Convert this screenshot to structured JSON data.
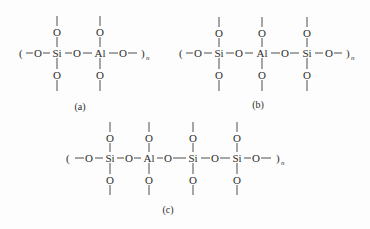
{
  "figure": {
    "background": "#fdfdfd",
    "ink_color": "#2b2b2b",
    "structures": [
      {
        "id": "a",
        "caption": "(a)",
        "open_paren": "(",
        "close_paren": ")",
        "repeat_subscript": "n",
        "chain": [
          "O",
          "Si",
          "O",
          "Al",
          "O"
        ],
        "centers": [
          {
            "element": "Si",
            "pendant_top": "O",
            "pendant_bottom": "O"
          },
          {
            "element": "Al",
            "pendant_top": "O",
            "pendant_bottom": "O"
          }
        ]
      },
      {
        "id": "b",
        "caption": "(b)",
        "open_paren": "(",
        "close_paren": ")",
        "repeat_subscript": "n",
        "chain": [
          "O",
          "Si",
          "O",
          "Al",
          "O",
          "Si",
          "O"
        ],
        "centers": [
          {
            "element": "Si",
            "pendant_top": "O",
            "pendant_bottom": "O"
          },
          {
            "element": "Al",
            "pendant_top": "O",
            "pendant_bottom": "O"
          },
          {
            "element": "Si",
            "pendant_top": "O",
            "pendant_bottom": "O"
          }
        ]
      },
      {
        "id": "c",
        "caption": "(c)",
        "open_paren": "(",
        "close_paren": ")",
        "repeat_subscript": "n",
        "chain": [
          "O",
          "Si",
          "O",
          "Al",
          "O",
          "Si",
          "O",
          "Si",
          "O"
        ],
        "centers": [
          {
            "element": "Si",
            "pendant_top": "O",
            "pendant_bottom": "O"
          },
          {
            "element": "Al",
            "pendant_top": "O",
            "pendant_bottom": "O"
          },
          {
            "element": "Si",
            "pendant_top": "O",
            "pendant_bottom": "O"
          },
          {
            "element": "Si",
            "pendant_top": "O",
            "pendant_bottom": "O"
          }
        ]
      }
    ]
  }
}
